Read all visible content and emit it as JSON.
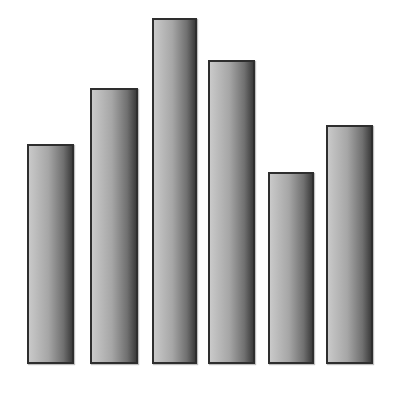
{
  "chart_data": {
    "type": "bar",
    "title": "",
    "xlabel": "",
    "ylabel": "",
    "categories": [
      "1",
      "2",
      "3",
      "4",
      "5",
      "6"
    ],
    "values": [
      220,
      276,
      346,
      304,
      192,
      239
    ],
    "ylim": [
      0,
      350
    ],
    "grid": false,
    "legend": null,
    "note": "No axes, tick labels or text rendered; values are relative bar heights",
    "style": {
      "bar_fill": "grey gradient",
      "bar_border": "#2e2e2e",
      "background": "#ffffff"
    }
  },
  "layout": {
    "baseline_y": 364,
    "bars": [
      {
        "left": 27,
        "width": 47
      },
      {
        "left": 90,
        "width": 48
      },
      {
        "left": 152,
        "width": 45
      },
      {
        "left": 208,
        "width": 47
      },
      {
        "left": 268,
        "width": 46
      },
      {
        "left": 326,
        "width": 47
      }
    ]
  }
}
